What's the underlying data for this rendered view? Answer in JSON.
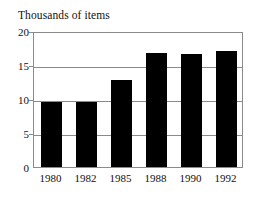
{
  "chart_data": {
    "type": "bar",
    "title": "Thousands of items",
    "xlabel": "",
    "ylabel": "",
    "categories": [
      "1980",
      "1982",
      "1985",
      "1988",
      "1990",
      "1992"
    ],
    "values": [
      9.5,
      9.5,
      12.8,
      16.8,
      16.6,
      17.0
    ],
    "ylim": [
      0,
      20
    ],
    "yticks": [
      0,
      5,
      10,
      15,
      20
    ],
    "ytick_labels": [
      "0",
      "5",
      "10",
      "15",
      "20"
    ],
    "grid": true,
    "grid_axis": "y",
    "legend": false,
    "legend_position": "none",
    "bar_color": "#000000",
    "frame_color": "#8a8a8a",
    "grid_color": "#8a8a8a",
    "background_color": "#ffffff",
    "text_color": "#111111"
  }
}
